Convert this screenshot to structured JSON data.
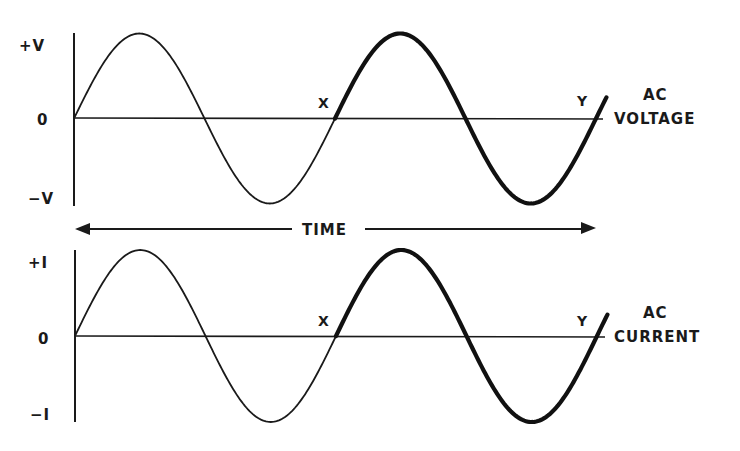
{
  "diagram": {
    "top_panel": {
      "label_line1": "AC",
      "label_line2": "VOLTAGE",
      "y_ticks": [
        "+V",
        "0",
        "−V"
      ],
      "marker_start": "X",
      "marker_end": "Y"
    },
    "time_axis": {
      "label": "TIME"
    },
    "bottom_panel": {
      "label_line1": "AC",
      "label_line2": "CURRENT",
      "y_ticks": [
        "+I",
        "0",
        "−I"
      ],
      "marker_start": "X",
      "marker_end": "Y"
    },
    "colors": {
      "ink": "#1a1a1a",
      "background": "#ffffff"
    }
  },
  "chart_data": [
    {
      "type": "line",
      "title": "AC VOLTAGE",
      "xlabel": "TIME",
      "ylabel": "Voltage",
      "y_tick_labels": [
        "+V",
        "0",
        "−V"
      ],
      "waveform": "sine",
      "cycles_shown": 2.04,
      "highlighted_cycle": {
        "from": "X",
        "to": "Y",
        "description": "one complete cycle drawn with thick line"
      },
      "points_x_cycles": [
        0,
        0.25,
        0.5,
        0.75,
        1.0,
        1.25,
        1.5,
        1.75,
        2.0
      ],
      "points_y": [
        0,
        1,
        0,
        -1,
        0,
        1,
        0,
        -1,
        0
      ],
      "ylim": [
        -1,
        1
      ]
    },
    {
      "type": "line",
      "title": "AC CURRENT",
      "xlabel": "TIME",
      "ylabel": "Current",
      "y_tick_labels": [
        "+I",
        "0",
        "−I"
      ],
      "waveform": "sine",
      "cycles_shown": 2.04,
      "highlighted_cycle": {
        "from": "X",
        "to": "Y",
        "description": "one complete cycle drawn with thick line"
      },
      "points_x_cycles": [
        0,
        0.25,
        0.5,
        0.75,
        1.0,
        1.25,
        1.5,
        1.75,
        2.0
      ],
      "points_y": [
        0,
        1,
        0,
        -1,
        0,
        1,
        0,
        -1,
        0
      ],
      "ylim": [
        -1,
        1
      ]
    }
  ]
}
